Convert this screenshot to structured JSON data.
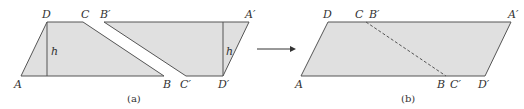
{
  "figure_a": {
    "caption": "(a)",
    "labels": {
      "A": "A",
      "B": "B",
      "C": "C",
      "D": "D",
      "A_prime": "A′",
      "B_prime": "B′",
      "C_prime": "C′",
      "D_prime": "D′",
      "h_left": "h",
      "h_right": "h"
    }
  },
  "figure_b": {
    "caption": "(b)",
    "labels": {
      "A": "A",
      "B": "B",
      "C": "C",
      "D": "D",
      "A_prime": "A′",
      "B_prime": "B′",
      "C_prime": "C′",
      "D_prime": "D′"
    }
  },
  "colors": {
    "fill": "#e0e0e0",
    "stroke": "#555555"
  }
}
